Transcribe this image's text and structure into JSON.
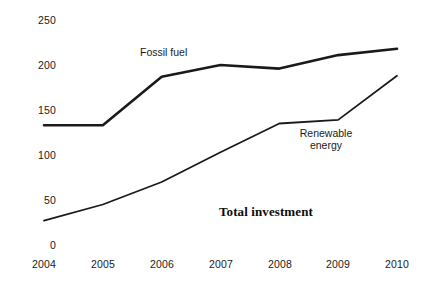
{
  "chart_data": {
    "type": "line",
    "title": "",
    "subtitle": "",
    "xlabel": "",
    "ylabel": "",
    "categories": [
      "2004",
      "2005",
      "2006",
      "2007",
      "2008",
      "2009",
      "2010"
    ],
    "x": [
      2004,
      2005,
      2006,
      2007,
      2008,
      2009,
      2010
    ],
    "xlim": [
      2004,
      2010
    ],
    "ylim": [
      0,
      250
    ],
    "y_ticks": [
      0,
      50,
      100,
      150,
      200,
      250
    ],
    "y_tick_labels": [
      "0",
      "50",
      "100",
      "150",
      "200",
      "250"
    ],
    "grid": false,
    "legend_position": "inline-annotations",
    "series": [
      {
        "name": "Fossil fuel",
        "values": [
          133,
          133,
          187,
          200,
          196,
          211,
          218
        ],
        "color": "#1a1a1a",
        "line_width": 2.6
      },
      {
        "name": "Renewable energy",
        "values": [
          27,
          45,
          70,
          103,
          135,
          139,
          188
        ],
        "color": "#1a1a1a",
        "line_width": 1.8
      }
    ],
    "annotations": [
      {
        "text": "Fossil fuel",
        "x": 140,
        "y": 47,
        "style": "sans"
      },
      {
        "text": "Renewable",
        "x": 295,
        "y": 129,
        "style": "sans"
      },
      {
        "text": "energy",
        "x": 295,
        "y": 140,
        "style": "sans"
      },
      {
        "text": "Total investment",
        "x": 219,
        "y": 204,
        "style": "serif-bold"
      }
    ]
  },
  "annotations": {
    "fossil_fuel": "Fossil fuel",
    "renewable_line1": "Renewable",
    "renewable_line2": "energy",
    "total_investment": "Total investment"
  },
  "y_axis": {
    "labels": [
      "250",
      "200",
      "150",
      "100",
      "50",
      "0"
    ]
  },
  "x_axis": {
    "labels": [
      "2004",
      "2005",
      "2006",
      "2007",
      "2008",
      "2009",
      "2010"
    ]
  },
  "colors": {
    "line": "#1a1a1a",
    "text": "#1a1a1a",
    "background": "#ffffff"
  }
}
